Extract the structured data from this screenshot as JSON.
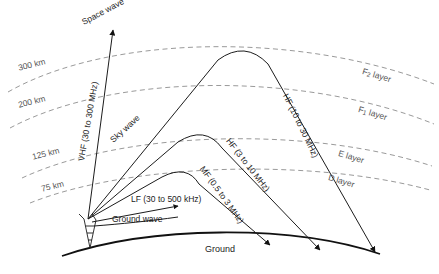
{
  "figure": {
    "background": "#ffffff",
    "width": 439,
    "height": 274
  },
  "colors": {
    "ionosphere_dash": "#9a9a9a",
    "wave_stroke": "#1c1c1c",
    "ground_stroke": "#111111",
    "label_text": "#2a2a2a",
    "muted_text": "#555555"
  },
  "ground": {
    "label": "Ground"
  },
  "transmitter": {
    "name": "antenna-tower"
  },
  "altitudes": [
    {
      "label": "300 km",
      "x": 17,
      "y": 63,
      "rotate": -14
    },
    {
      "label": "200 km",
      "x": 17,
      "y": 100,
      "rotate": -14
    },
    {
      "label": "125 km",
      "x": 31,
      "y": 152,
      "rotate": -14
    },
    {
      "label": "75 km",
      "x": 40,
      "y": 184,
      "rotate": -14
    }
  ],
  "layers": [
    {
      "label": "F",
      "sub": "2",
      "suffix": " layer",
      "x": 364,
      "y": 66,
      "rotate": 17
    },
    {
      "label": "F",
      "sub": "1",
      "suffix": " layer",
      "x": 360,
      "y": 104,
      "rotate": 17
    },
    {
      "label": "E",
      "sub": "",
      "suffix": " layer",
      "x": 340,
      "y": 148,
      "rotate": 17
    },
    {
      "label": "D",
      "sub": "",
      "suffix": " layer",
      "x": 330,
      "y": 172,
      "rotate": 17
    }
  ],
  "waves": [
    {
      "name": "space-wave",
      "label": "Space wave",
      "x": 80,
      "y": 18,
      "rotate": -28
    },
    {
      "name": "vhf-wave",
      "label": "VHF (30 to 300 MHz)",
      "x": 76,
      "y": 160,
      "rotate": -80
    },
    {
      "name": "sky-wave",
      "label": "Sky wave",
      "x": 108,
      "y": 137,
      "rotate": -42
    },
    {
      "name": "hf-high-wave",
      "label": "HF (10 to 30 MHz)",
      "x": 290,
      "y": 92,
      "rotate": 64
    },
    {
      "name": "hf-low-wave",
      "label": "HF (3 to 10 MHz)",
      "x": 232,
      "y": 136,
      "rotate": 52
    },
    {
      "name": "mf-wave",
      "label": "MF (0.5 to 3 MHz)",
      "x": 206,
      "y": 164,
      "rotate": 54
    },
    {
      "name": "lf-wave",
      "label": "LF (30 to 500 kHz)",
      "x": 131,
      "y": 194,
      "rotate": 0
    },
    {
      "name": "ground-wave",
      "label": "Ground wave",
      "x": 112,
      "y": 214,
      "rotate": 0
    }
  ],
  "ground_label": {
    "label": "Ground",
    "x": 205,
    "y": 244
  }
}
